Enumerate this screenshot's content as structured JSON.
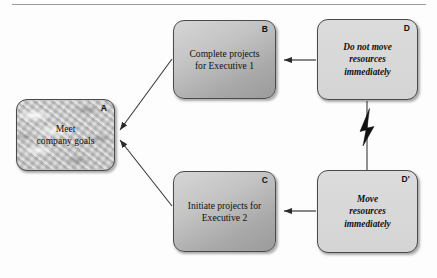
{
  "diagram": {
    "background_color": "#fdfdfd",
    "stroke_color": "#4a4a4a",
    "nodes": [
      {
        "id": "A",
        "label": "A",
        "text": "Meet\ncompany goals",
        "line1": "Meet",
        "line2": "company goals",
        "style": "marble-texture",
        "italic": false,
        "fill_color": "#c9c9c9"
      },
      {
        "id": "B",
        "label": "B",
        "text": "Complete projects\nfor Executive 1",
        "line1": "Complete projects",
        "line2": "for Executive 1",
        "style": "gray-gradient",
        "italic": false,
        "fill_color": "#b8b8b8"
      },
      {
        "id": "C",
        "label": "C",
        "text": "Initiate projects for\nExecutive 2",
        "line1": "Initiate projects for",
        "line2": "Executive 2",
        "style": "gray-gradient",
        "italic": false,
        "fill_color": "#b8b8b8"
      },
      {
        "id": "D",
        "label": "D",
        "text": "Do not move\nresources\nimmediately",
        "line1": "Do not move",
        "line2": "resources",
        "line3": "immediately",
        "style": "light-flat",
        "italic": true,
        "fill_color": "#dadada"
      },
      {
        "id": "Dprime",
        "label": "D'",
        "text": "Move\nresources\nimmediately",
        "line1": "Move",
        "line2": "resources",
        "line3": "immediately",
        "style": "light-flat",
        "italic": true,
        "fill_color": "#dadada"
      }
    ],
    "connectors": [
      {
        "id": "b-to-a",
        "from": "B",
        "to": "A",
        "kind": "arrow",
        "style": "diagonal"
      },
      {
        "id": "c-to-a",
        "from": "C",
        "to": "A",
        "kind": "arrow",
        "style": "diagonal"
      },
      {
        "id": "d-to-b",
        "from": "D",
        "to": "B",
        "kind": "arrow",
        "style": "horizontal"
      },
      {
        "id": "dprime-to-c",
        "from": "D'",
        "to": "C",
        "kind": "arrow",
        "style": "horizontal"
      },
      {
        "id": "d-to-dprime",
        "from": "D",
        "to": "D'",
        "kind": "lightning",
        "style": "vertical-bolt"
      }
    ]
  }
}
